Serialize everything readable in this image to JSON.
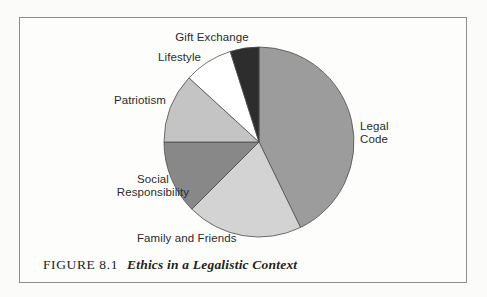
{
  "figure": {
    "caption_prefix": "FIGURE 8.1",
    "caption_title": "Ethics in a Legalistic Context"
  },
  "chart_data": {
    "type": "pie",
    "title": "Ethics in a Legalistic Context",
    "start_angle_deg": 0,
    "direction": "clockwise",
    "legend": "none",
    "labels_position": "outside-adjacent",
    "outline_color": "#4f4f4f",
    "slices": [
      {
        "label": "Legal Code",
        "value_pct": 42.8,
        "color": "#9c9c9c"
      },
      {
        "label": "Family and Friends",
        "value_pct": 19.7,
        "color": "#d3d3d3"
      },
      {
        "label": "Social Responsibility",
        "value_pct": 12.5,
        "color": "#888888"
      },
      {
        "label": "Patriotism",
        "value_pct": 11.8,
        "color": "#c4c4c4"
      },
      {
        "label": "Lifestyle",
        "value_pct": 8.3,
        "color": "#ffffff"
      },
      {
        "label": "Gift Exchange",
        "value_pct": 4.9,
        "color": "#2d2d2d"
      }
    ]
  }
}
